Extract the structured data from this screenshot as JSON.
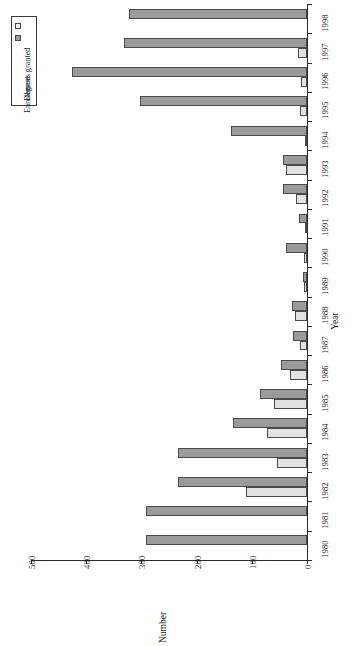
{
  "chart_data": {
    "type": "bar",
    "orientation": "horizontal",
    "title": "",
    "xlabel": "Year",
    "ylabel": "Number",
    "ylim": [
      0,
      500
    ],
    "yticks": [
      0,
      100,
      200,
      300,
      400,
      500
    ],
    "grid": false,
    "legend_position": "top-left",
    "categories": [
      "1980",
      "1981",
      "1982",
      "1983",
      "1984",
      "1985",
      "1986",
      "1987",
      "1988",
      "1989",
      "1990",
      "1991",
      "1992",
      "1993",
      "1994",
      "1995",
      "1996",
      "1997",
      "1998"
    ],
    "series": [
      {
        "name": "Degrees granted",
        "color": "#e2e2e2",
        "values": [
          0,
          0,
          110,
          55,
          72,
          60,
          30,
          12,
          22,
          5,
          6,
          3,
          20,
          38,
          4,
          13,
          10,
          16,
          0
        ]
      },
      {
        "name": "Enrollment",
        "color": "#9b9b9b",
        "values": [
          292,
          292,
          234,
          234,
          134,
          85,
          48,
          25,
          27,
          8,
          38,
          14,
          43,
          43,
          137,
          303,
          426,
          332,
          322
        ]
      }
    ]
  },
  "legend": {
    "items": [
      {
        "label": "Degrees granted",
        "swatch": "degrees"
      },
      {
        "label": "Enrollment",
        "swatch": "enrollment"
      }
    ]
  },
  "axes": {
    "category_axis_title": "Year",
    "value_axis_title": "Number",
    "value_ticks": [
      "500",
      "400",
      "300",
      "200",
      "100",
      "0"
    ],
    "category_ticks": [
      "1998",
      "1997",
      "1996",
      "1995",
      "1994",
      "1993",
      "1992",
      "1991",
      "1990",
      "1989",
      "1988",
      "1987",
      "1986",
      "1985",
      "1984",
      "1983",
      "1982",
      "1981",
      "1980"
    ]
  }
}
